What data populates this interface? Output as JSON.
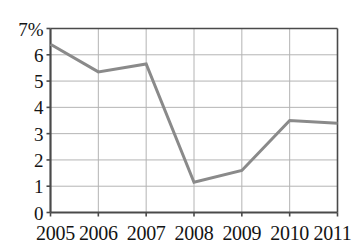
{
  "chart_data": {
    "type": "line",
    "title": "",
    "subtitle": "",
    "xlabel": "",
    "ylabel": "",
    "categories": [
      "2005",
      "2006",
      "2007",
      "2008",
      "2009",
      "2010",
      "2011"
    ],
    "x": [
      2005,
      2006,
      2007,
      2008,
      2009,
      2010,
      2011
    ],
    "values": [
      6.4,
      5.35,
      5.65,
      1.15,
      1.6,
      3.5,
      3.4
    ],
    "series": [
      {
        "name": "",
        "values": [
          6.4,
          5.35,
          5.65,
          1.15,
          1.6,
          3.5,
          3.4
        ]
      }
    ],
    "ylim": [
      0,
      7
    ],
    "xlim": [
      2005,
      2011
    ],
    "y_ticks": [
      0,
      1,
      2,
      3,
      4,
      5,
      6,
      7
    ],
    "y_tick_labels": [
      "0",
      "1",
      "2",
      "3",
      "4",
      "5",
      "6",
      "7%"
    ],
    "x_ticks": [
      2005,
      2006,
      2007,
      2008,
      2009,
      2010,
      2011
    ],
    "x_tick_labels": [
      "2005",
      "2006",
      "2007",
      "2008",
      "2009",
      "2010",
      "2011"
    ],
    "unit": "%",
    "grid": true,
    "grid_x": true,
    "grid_y": true,
    "legend": false,
    "legend_position": "none",
    "annotations": [],
    "colors": {
      "line": "#8a8a8a",
      "grid": "#b4b4b4",
      "axis": "#4a4a4a",
      "text": "#141414",
      "background": "#ffffff"
    },
    "line_width": 3
  }
}
